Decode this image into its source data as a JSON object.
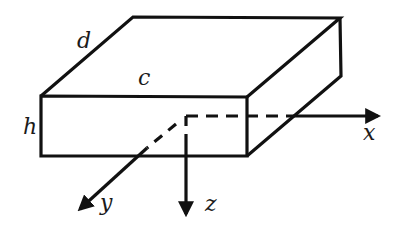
{
  "diagram": {
    "title": "",
    "type": "rectangular plate with coordinate axes",
    "colors": {
      "stroke": "#111111",
      "background": "#ffffff"
    },
    "dimension_labels": {
      "length": "c",
      "depth": "d",
      "height": "h"
    },
    "axes": [
      {
        "name": "x",
        "direction": "right"
      },
      {
        "name": "y",
        "direction": "down-left (toward viewer)"
      },
      {
        "name": "z",
        "direction": "down"
      }
    ],
    "origin_note": "axes originate at center of the plate (hidden lines dashed)"
  }
}
